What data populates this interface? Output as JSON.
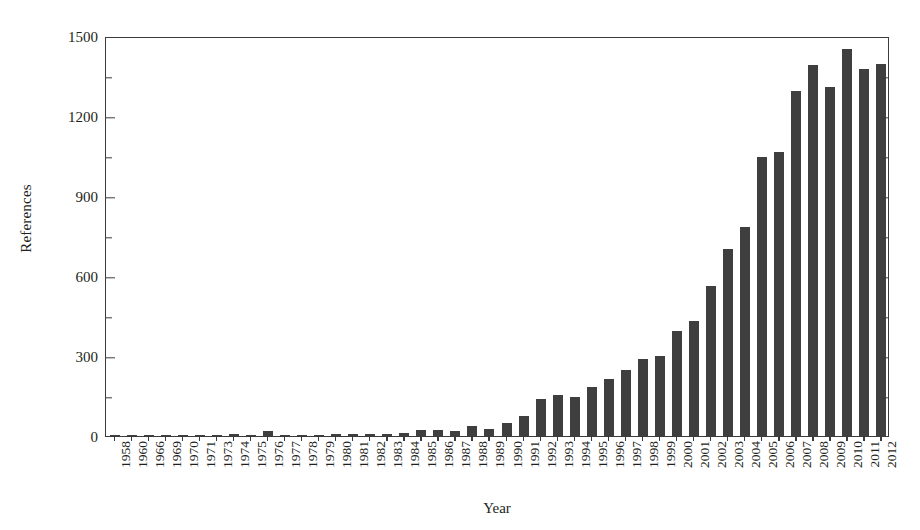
{
  "chart_data": {
    "type": "bar",
    "title": "",
    "xlabel": "Year",
    "ylabel": "References",
    "ylim": [
      0,
      1500
    ],
    "ytick_labels": [
      "0",
      "300",
      "600",
      "900",
      "1200",
      "1500"
    ],
    "ytick_values": [
      0,
      300,
      600,
      900,
      1200,
      1500
    ],
    "yminor_values": [
      150,
      450,
      750,
      1050,
      1350
    ],
    "grid": false,
    "legend": false,
    "bar_color": "#3f3f3f",
    "axis_color": "#3b3b3b",
    "background": "#ffffff",
    "categories": [
      "1958",
      "1960",
      "1966",
      "1969",
      "1970",
      "1971",
      "1973",
      "1974",
      "1975",
      "1976",
      "1977",
      "1978",
      "1979",
      "1980",
      "1981",
      "1982",
      "1983",
      "1984",
      "1985",
      "1986",
      "1987",
      "1988",
      "1989",
      "1990",
      "1991",
      "1992",
      "1993",
      "1994",
      "1995",
      "1996",
      "1997",
      "1998",
      "1999",
      "2000",
      "2001",
      "2002",
      "2003",
      "2004",
      "2005",
      "2006",
      "2007",
      "2008",
      "2009",
      "2010",
      "2011",
      "2012"
    ],
    "values": [
      2,
      2,
      2,
      3,
      3,
      4,
      5,
      6,
      4,
      18,
      4,
      4,
      5,
      6,
      6,
      7,
      8,
      12,
      22,
      24,
      20,
      38,
      28,
      48,
      75,
      138,
      155,
      148,
      185,
      212,
      248,
      290,
      300,
      392,
      430,
      563,
      700,
      785,
      1048,
      1065,
      1295,
      1390,
      1310,
      1450,
      1375,
      1395
    ]
  }
}
